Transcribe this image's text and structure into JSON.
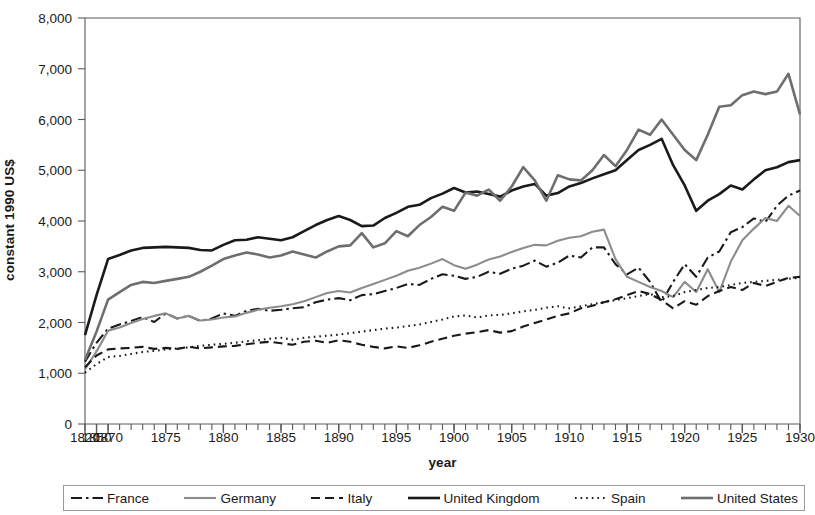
{
  "chart_data": {
    "type": "line",
    "title": "",
    "subtitle": "",
    "xlabel": "year",
    "ylabel": "constant 1990 US$",
    "ylim": [
      0,
      8000
    ],
    "ytick_labels": [
      "0",
      "1,000",
      "2,000",
      "3,000",
      "4,000",
      "5,000",
      "6,000",
      "7,000",
      "8,000"
    ],
    "ytick_values": [
      0,
      1000,
      2000,
      3000,
      4000,
      5000,
      6000,
      7000,
      8000
    ],
    "xtick_labels": [
      "1820",
      "1850",
      "1870",
      "1875",
      "1880",
      "1885",
      "1890",
      "1895",
      "1900",
      "1905",
      "1910",
      "1915",
      "1920",
      "1925",
      "1930"
    ],
    "xtick_values": [
      1820,
      1850,
      1870,
      1875,
      1880,
      1885,
      1890,
      1895,
      1900,
      1905,
      1910,
      1915,
      1920,
      1925,
      1930
    ],
    "grid": false,
    "legend_position": "bottom",
    "x_axis_note": "ordinal spacing: 1820 and 1850 are single steps, then yearly from 1870 to 1930",
    "x": [
      1820,
      1850,
      1870,
      1871,
      1872,
      1873,
      1874,
      1875,
      1876,
      1877,
      1878,
      1879,
      1880,
      1881,
      1882,
      1883,
      1884,
      1885,
      1886,
      1887,
      1888,
      1889,
      1890,
      1891,
      1892,
      1893,
      1894,
      1895,
      1896,
      1897,
      1898,
      1899,
      1900,
      1901,
      1902,
      1903,
      1904,
      1905,
      1906,
      1907,
      1908,
      1909,
      1910,
      1911,
      1912,
      1913,
      1914,
      1915,
      1916,
      1917,
      1918,
      1919,
      1920,
      1921,
      1922,
      1923,
      1924,
      1925,
      1926,
      1927,
      1928,
      1929,
      1930
    ],
    "series": [
      {
        "name": "France",
        "style": "dash-dot",
        "color": "#1a1a1a",
        "width": 2.1,
        "values": [
          1230,
          1600,
          1880,
          1960,
          2030,
          2110,
          2010,
          2180,
          2080,
          2130,
          2030,
          2080,
          2180,
          2130,
          2230,
          2270,
          2230,
          2250,
          2280,
          2300,
          2400,
          2450,
          2480,
          2440,
          2540,
          2560,
          2620,
          2680,
          2760,
          2740,
          2860,
          2950,
          2920,
          2860,
          2900,
          3000,
          2960,
          3060,
          3120,
          3220,
          3100,
          3180,
          3320,
          3280,
          3480,
          3480,
          3150,
          2950,
          3080,
          2800,
          2400,
          2800,
          3150,
          2900,
          3280,
          3400,
          3780,
          3880,
          4050,
          3980,
          4300,
          4500,
          4600
        ]
      },
      {
        "name": "Germany",
        "style": "solid",
        "color": "#8c8c8c",
        "width": 2.1,
        "values": [
          1080,
          1430,
          1840,
          1900,
          1990,
          2070,
          2130,
          2180,
          2080,
          2130,
          2040,
          2060,
          2100,
          2120,
          2190,
          2250,
          2290,
          2320,
          2360,
          2420,
          2500,
          2580,
          2620,
          2590,
          2680,
          2760,
          2840,
          2920,
          3020,
          3080,
          3160,
          3250,
          3130,
          3060,
          3140,
          3240,
          3300,
          3390,
          3470,
          3530,
          3520,
          3610,
          3670,
          3700,
          3790,
          3830,
          3250,
          2900,
          2800,
          2700,
          2620,
          2500,
          2800,
          2600,
          3050,
          2600,
          3200,
          3620,
          3850,
          4060,
          4000,
          4300,
          4100
        ]
      },
      {
        "name": "Italy",
        "style": "dashed",
        "color": "#1a1a1a",
        "width": 2.1,
        "values": [
          1120,
          1350,
          1470,
          1490,
          1500,
          1520,
          1480,
          1500,
          1480,
          1520,
          1490,
          1510,
          1530,
          1540,
          1570,
          1600,
          1620,
          1590,
          1560,
          1620,
          1640,
          1600,
          1650,
          1620,
          1560,
          1520,
          1490,
          1530,
          1500,
          1550,
          1620,
          1680,
          1740,
          1780,
          1810,
          1850,
          1800,
          1830,
          1920,
          1990,
          2060,
          2130,
          2180,
          2280,
          2330,
          2400,
          2460,
          2540,
          2620,
          2560,
          2440,
          2280,
          2420,
          2350,
          2520,
          2620,
          2700,
          2640,
          2780,
          2720,
          2800,
          2880,
          2900
        ]
      },
      {
        "name": "United Kingdom",
        "style": "solid",
        "color": "#1a1a1a",
        "width": 2.6,
        "values": [
          1750,
          2540,
          3250,
          3330,
          3420,
          3470,
          3480,
          3490,
          3480,
          3470,
          3430,
          3420,
          3530,
          3620,
          3630,
          3680,
          3650,
          3620,
          3680,
          3800,
          3920,
          4020,
          4100,
          4020,
          3900,
          3910,
          4060,
          4160,
          4280,
          4320,
          4450,
          4540,
          4650,
          4560,
          4580,
          4530,
          4480,
          4600,
          4680,
          4730,
          4500,
          4550,
          4680,
          4750,
          4840,
          4920,
          5000,
          5200,
          5400,
          5500,
          5620,
          5100,
          4700,
          4200,
          4400,
          4530,
          4700,
          4620,
          4820,
          5000,
          5060,
          5160,
          5200
        ]
      },
      {
        "name": "Spain",
        "style": "dotted",
        "color": "#1a1a1a",
        "width": 2.1,
        "values": [
          1010,
          1180,
          1320,
          1340,
          1380,
          1420,
          1440,
          1470,
          1490,
          1510,
          1540,
          1560,
          1580,
          1600,
          1630,
          1650,
          1680,
          1700,
          1660,
          1700,
          1720,
          1740,
          1760,
          1790,
          1820,
          1850,
          1880,
          1900,
          1930,
          1960,
          2010,
          2060,
          2120,
          2140,
          2100,
          2140,
          2150,
          2180,
          2220,
          2250,
          2290,
          2320,
          2280,
          2320,
          2360,
          2400,
          2440,
          2480,
          2520,
          2560,
          2500,
          2520,
          2600,
          2640,
          2680,
          2700,
          2740,
          2780,
          2800,
          2820,
          2840,
          2860,
          2880
        ]
      },
      {
        "name": "United States",
        "style": "solid",
        "color": "#6e6e6e",
        "width": 2.6,
        "values": [
          1260,
          1820,
          2450,
          2600,
          2740,
          2800,
          2780,
          2820,
          2860,
          2900,
          3000,
          3120,
          3250,
          3320,
          3380,
          3340,
          3280,
          3320,
          3400,
          3340,
          3280,
          3400,
          3500,
          3520,
          3760,
          3480,
          3560,
          3800,
          3700,
          3920,
          4080,
          4280,
          4200,
          4560,
          4500,
          4620,
          4400,
          4680,
          5060,
          4800,
          4400,
          4900,
          4820,
          4800,
          5000,
          5300,
          5080,
          5400,
          5800,
          5700,
          6000,
          5700,
          5400,
          5200,
          5700,
          6250,
          6280,
          6480,
          6550,
          6500,
          6550,
          6900,
          6100
        ]
      }
    ]
  },
  "axis": {
    "ylabel": "constant 1990 US$",
    "xlabel": "year"
  },
  "legend": {
    "items": [
      {
        "label": "France",
        "style": "dash-dot",
        "color": "#1a1a1a"
      },
      {
        "label": "Germany",
        "style": "solid",
        "color": "#8c8c8c"
      },
      {
        "label": "Italy",
        "style": "dashed",
        "color": "#1a1a1a"
      },
      {
        "label": "United Kingdom",
        "style": "solid-thick",
        "color": "#1a1a1a"
      },
      {
        "label": "Spain",
        "style": "dotted",
        "color": "#1a1a1a"
      },
      {
        "label": "United States",
        "style": "solid-thick-gray",
        "color": "#6e6e6e"
      }
    ]
  }
}
